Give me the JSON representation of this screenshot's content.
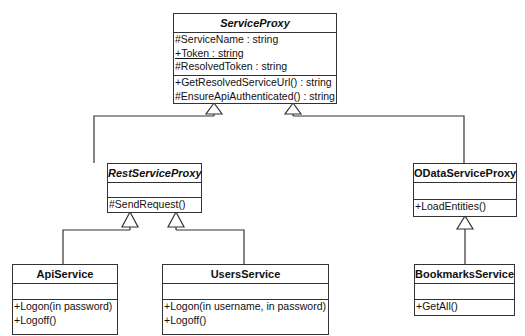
{
  "classes": {
    "service_proxy": {
      "name": "ServiceProxy",
      "attributes": [
        "#ServiceName : string",
        "+Token : string",
        "#ResolvedToken : string"
      ],
      "operations": [
        "+GetResolvedServiceUrl() : string",
        "#EnsureApiAuthenticated() : string"
      ]
    },
    "rest_service_proxy": {
      "name": "RestServiceProxy",
      "attributes": [],
      "operations": [
        "#SendRequest()"
      ]
    },
    "odata_service_proxy": {
      "name": "ODataServiceProxy",
      "attributes": [],
      "operations": [
        "+LoadEntities()"
      ]
    },
    "api_service": {
      "name": "ApiService",
      "attributes": [],
      "operations": [
        "+Logon(in password)",
        "+Logoff()"
      ]
    },
    "users_service": {
      "name": "UsersService",
      "attributes": [],
      "operations": [
        "+Logon(in username, in password)",
        "+Logoff()"
      ]
    },
    "bookmarks_service": {
      "name": "BookmarksService",
      "attributes": [],
      "operations": [
        "+GetAll()"
      ]
    }
  },
  "relations": [
    {
      "type": "generalization",
      "from": "RestServiceProxy",
      "to": "ServiceProxy"
    },
    {
      "type": "generalization",
      "from": "ODataServiceProxy",
      "to": "ServiceProxy"
    },
    {
      "type": "generalization",
      "from": "ApiService",
      "to": "RestServiceProxy"
    },
    {
      "type": "generalization",
      "from": "UsersService",
      "to": "RestServiceProxy"
    },
    {
      "type": "generalization",
      "from": "BookmarksService",
      "to": "ODataServiceProxy"
    }
  ]
}
